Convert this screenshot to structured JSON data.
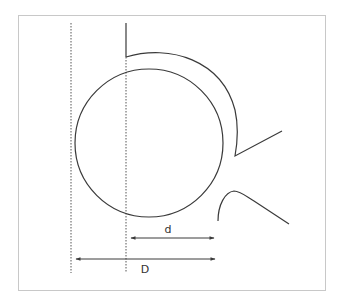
{
  "diagram": {
    "labels": {
      "small_dimension": "d",
      "large_dimension": "D"
    },
    "colors": {
      "stroke": "#3a3a3a",
      "border": "#c8c8c8",
      "dotted": "#555555",
      "background": "#ffffff"
    }
  }
}
